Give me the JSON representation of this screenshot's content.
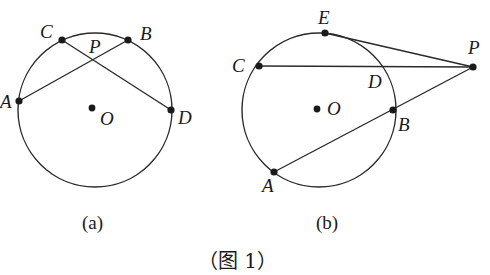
{
  "figure_title": "（图 1）",
  "panels": [
    {
      "caption": "(a)",
      "circle": {
        "cx": 95,
        "cy": 110,
        "r": 77
      },
      "points": {
        "A": {
          "x": 19,
          "y": 101,
          "label": "A"
        },
        "B": {
          "x": 128,
          "y": 40,
          "label": "B"
        },
        "C": {
          "x": 62,
          "y": 40,
          "label": "C"
        },
        "D": {
          "x": 171,
          "y": 110,
          "label": "D"
        },
        "O": {
          "x": 92,
          "y": 108,
          "label": "O"
        },
        "P": {
          "label": "P"
        }
      },
      "segments": [
        [
          "A",
          "B"
        ],
        [
          "C",
          "D"
        ]
      ]
    },
    {
      "caption": "(b)",
      "circle": {
        "cx": 319,
        "cy": 110,
        "r": 76
      },
      "points": {
        "A": {
          "x": 274,
          "y": 172,
          "label": "A"
        },
        "B": {
          "x": 393,
          "y": 110,
          "label": "B"
        },
        "C": {
          "x": 259,
          "y": 66,
          "label": "C"
        },
        "D": {
          "label": "D"
        },
        "E": {
          "x": 325,
          "y": 33,
          "label": "E"
        },
        "O": {
          "x": 317,
          "y": 109,
          "label": "O"
        },
        "P": {
          "x": 473,
          "y": 67,
          "label": "P"
        }
      },
      "segments": [
        [
          "C",
          "P"
        ],
        [
          "A",
          "P"
        ],
        [
          "E",
          "P"
        ]
      ]
    }
  ]
}
